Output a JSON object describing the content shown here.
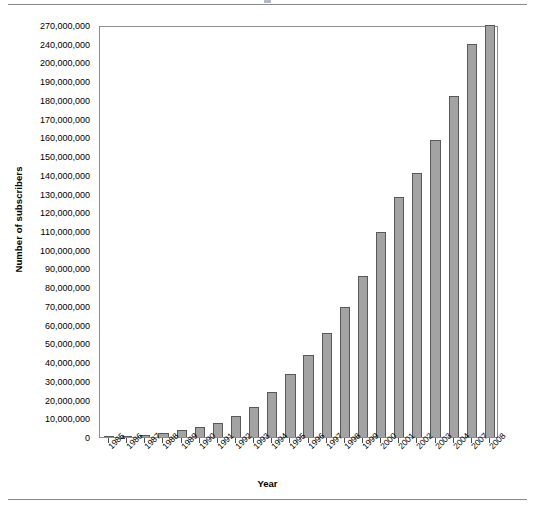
{
  "chart_data": {
    "type": "bar",
    "title": "",
    "xlabel": "Year",
    "ylabel": "Number of subscribers",
    "categories": [
      "1985",
      "1986",
      "1987",
      "1988",
      "1989",
      "1990",
      "1991",
      "1992",
      "1993",
      "1994",
      "1995",
      "1996",
      "1997",
      "1998",
      "1999",
      "2000",
      "2001",
      "2002",
      "2003",
      "2004",
      "2007",
      "2008"
    ],
    "values": [
      340000,
      682000,
      1231000,
      2069000,
      3509000,
      5283000,
      7557000,
      11033000,
      16009000,
      24134000,
      33786000,
      44043000,
      55312000,
      69209000,
      86047000,
      109478000,
      128375000,
      140767000,
      158722000,
      182140000,
      240000000,
      270000000
    ],
    "ytick_labels": [
      "0",
      "10,000,000",
      "20,000,000",
      "30,000,000",
      "40,000,000",
      "50,000,000",
      "60,000,000",
      "70,000,000",
      "80,000,000",
      "90,000,000",
      "100,000,000",
      "110,000,000",
      "120,000,000",
      "130,000,000",
      "140,000,000",
      "150,000,000",
      "160,000,000",
      "170,000,000",
      "180,000,000",
      "190,000,000",
      "200,000,000",
      "240,000,000",
      "270,000,000"
    ],
    "ytick_values": [
      0,
      10000000,
      20000000,
      30000000,
      40000000,
      50000000,
      60000000,
      70000000,
      80000000,
      90000000,
      100000000,
      110000000,
      120000000,
      130000000,
      140000000,
      150000000,
      160000000,
      170000000,
      180000000,
      190000000,
      200000000,
      240000000,
      270000000
    ],
    "ylim": [
      0,
      270000000
    ],
    "grid": false,
    "legend": "none",
    "bar_color": "#a3a3a3",
    "bar_border_color": "#595959",
    "axis_color": "#8e8e8e",
    "note": "Y axis tick spacing is uniform per listed label, not linear in value (200M, 240M, 270M are one step apart each)."
  }
}
